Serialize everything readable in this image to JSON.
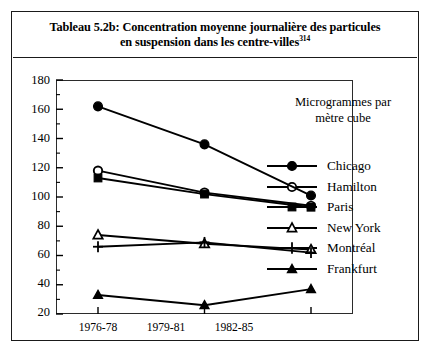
{
  "title": {
    "line1": "Tableau 5.2b: Concentration moyenne journalière des particules",
    "line2_text": "en suspension dans les centre-villes",
    "line2_superscript": "314"
  },
  "units_label": {
    "line1": "Microgrammes par",
    "line2": "mètre cube"
  },
  "axis": {
    "y_ticks": [
      "180",
      "160",
      "140",
      "120",
      "100",
      "80",
      "60",
      "40",
      "20"
    ],
    "x_ticks": [
      "1976-78",
      "1979-81",
      "1982-85"
    ]
  },
  "legend": {
    "items": [
      {
        "label": "Chicago",
        "marker": "filled-circle-marker"
      },
      {
        "label": "Hamilton",
        "marker": "open-circle-marker"
      },
      {
        "label": "Paris",
        "marker": "filled-square-marker"
      },
      {
        "label": "New York",
        "marker": "open-triangle-marker"
      },
      {
        "label": "Montréal",
        "marker": "plus-marker"
      },
      {
        "label": "Frankfurt",
        "marker": "filled-triangle-marker"
      }
    ]
  },
  "colors": {
    "ink": "#000000",
    "frame": "#1a1a1a",
    "plot_border": "#2b2b2b",
    "background": "#ffffff"
  },
  "chart_data": {
    "type": "line",
    "title": "Tableau 5.2b: Concentration moyenne journalière des particules en suspension dans les centre-villes",
    "xlabel": "",
    "ylabel": "Microgrammes par mètre cube",
    "categories": [
      "1976-78",
      "1979-81",
      "1982-85"
    ],
    "ylim": [
      20,
      180
    ],
    "ytick_step": 20,
    "yminor_tick_step": 10,
    "grid": false,
    "legend_position": "right",
    "series": [
      {
        "name": "Chicago",
        "marker": "filled-circle",
        "values": [
          162,
          136,
          101
        ]
      },
      {
        "name": "Hamilton",
        "marker": "open-circle",
        "values": [
          118,
          103,
          94
        ]
      },
      {
        "name": "Paris",
        "marker": "filled-square",
        "values": [
          113,
          102,
          93
        ]
      },
      {
        "name": "New York",
        "marker": "open-triangle",
        "values": [
          74,
          68,
          64
        ]
      },
      {
        "name": "Montréal",
        "marker": "plus",
        "values": [
          66,
          69,
          62
        ]
      },
      {
        "name": "Frankfurt",
        "marker": "filled-triangle",
        "values": [
          33,
          26,
          37
        ]
      }
    ]
  }
}
